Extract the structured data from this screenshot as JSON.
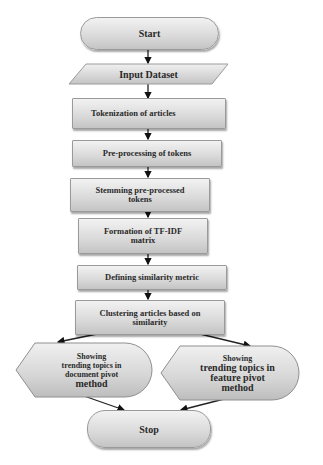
{
  "flowchart": {
    "nodes": {
      "start": "Start",
      "input": "Input Dataset",
      "tokenization": "Tokenization of articles",
      "preprocessing": "Pre-processing of tokens",
      "stemming": "Stemming pre-processed tokens",
      "tfidf": "Formation of TF-IDF matrix",
      "similarity": "Defining similarity metric",
      "clustering": "Clustering articles based on similarity",
      "doc_pivot": {
        "line1": "Showing",
        "line2": "trending topics in",
        "line3": "document pivot",
        "line4": "method"
      },
      "feat_pivot": {
        "line1": "Showing",
        "line2": "trending topics in",
        "line3": "feature pivot",
        "line4": "method"
      },
      "stop": "Stop"
    },
    "edges": [
      [
        "start",
        "input"
      ],
      [
        "input",
        "tokenization"
      ],
      [
        "tokenization",
        "preprocessing"
      ],
      [
        "preprocessing",
        "stemming"
      ],
      [
        "stemming",
        "tfidf"
      ],
      [
        "tfidf",
        "similarity"
      ],
      [
        "similarity",
        "clustering"
      ],
      [
        "clustering",
        "doc_pivot"
      ],
      [
        "clustering",
        "feat_pivot"
      ],
      [
        "doc_pivot",
        "stop"
      ],
      [
        "feat_pivot",
        "stop"
      ]
    ]
  }
}
